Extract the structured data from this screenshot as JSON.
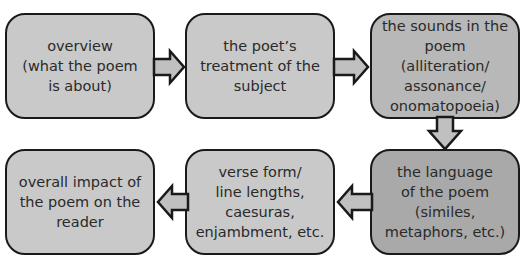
{
  "diagram": {
    "type": "flowchart",
    "steps": [
      {
        "id": 1,
        "label": "overview\n(what the poem\nis about)"
      },
      {
        "id": 2,
        "label": "the poet’s\ntreatment of the\nsubject"
      },
      {
        "id": 3,
        "label": "the sounds in the\npoem (alliteration/\nassonance/\nonomatopoeia)"
      },
      {
        "id": 4,
        "label": "the language\nof the poem\n(similes,\nmetaphors, etc.)"
      },
      {
        "id": 5,
        "label": "verse form/\nline lengths,\ncaesuras,\nenjambment, etc."
      },
      {
        "id": 6,
        "label": "overall impact of\nthe poem on the\nreader"
      }
    ],
    "arrows": [
      {
        "from": 1,
        "to": 2,
        "direction": "right"
      },
      {
        "from": 2,
        "to": 3,
        "direction": "right"
      },
      {
        "from": 3,
        "to": 4,
        "direction": "down"
      },
      {
        "from": 4,
        "to": 5,
        "direction": "left"
      },
      {
        "from": 5,
        "to": 6,
        "direction": "left"
      }
    ],
    "colors": {
      "box_light": "#c9c9c9",
      "box_mid": "#b8b8b8",
      "box_dark": "#a9a9a9",
      "border": "#1a1a1a",
      "arrow_fill": "#c0c0c0"
    }
  }
}
